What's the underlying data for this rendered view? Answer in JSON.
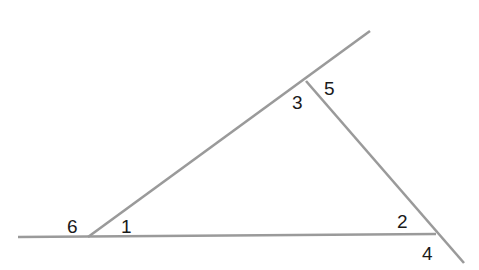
{
  "diagram": {
    "type": "triangle-exterior-angles",
    "line_color": "#9a9a9a",
    "label_color": "#1a1a1a",
    "lines": [
      {
        "name": "base-line",
        "x1": 18,
        "y1": 237,
        "x2": 436,
        "y2": 234
      },
      {
        "name": "left-side-line",
        "x1": 88,
        "y1": 237,
        "x2": 370,
        "y2": 31
      },
      {
        "name": "right-side-line",
        "x1": 306,
        "y1": 81,
        "x2": 464,
        "y2": 263
      }
    ],
    "vertices": [
      {
        "name": "A",
        "x": 88,
        "y": 237
      },
      {
        "name": "B",
        "x": 306,
        "y": 81
      },
      {
        "name": "C",
        "x": 436,
        "y": 234
      }
    ],
    "labels": [
      {
        "text": "1",
        "x": 121,
        "y": 233
      },
      {
        "text": "2",
        "x": 397,
        "y": 228
      },
      {
        "text": "3",
        "x": 292,
        "y": 109
      },
      {
        "text": "4",
        "x": 422,
        "y": 260
      },
      {
        "text": "5",
        "x": 324,
        "y": 95
      },
      {
        "text": "6",
        "x": 67,
        "y": 233
      }
    ]
  }
}
